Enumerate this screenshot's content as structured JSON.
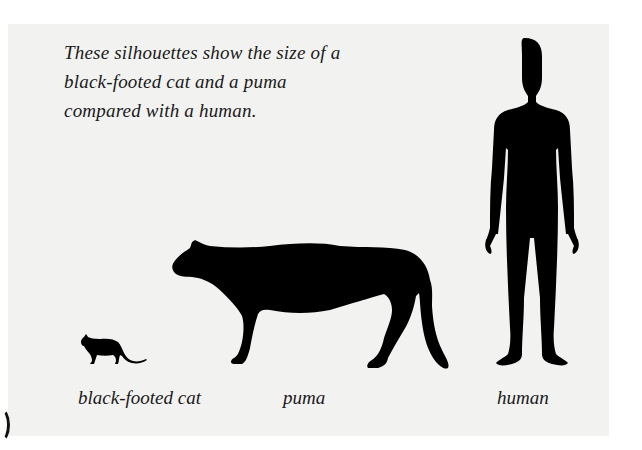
{
  "figure": {
    "caption_lines": [
      "These silhouettes show the size of a",
      "black-footed cat and a puma",
      "compared with a human."
    ],
    "labels": {
      "cat": "black-footed cat",
      "puma": "puma",
      "human": "human"
    },
    "colors": {
      "page_background": "#ffffff",
      "panel_background": "#f2f2f1",
      "silhouette": "#000000",
      "text": "#1a1a1a"
    },
    "silhouettes": [
      {
        "name": "black-footed cat",
        "icon": "cat-silhouette-icon"
      },
      {
        "name": "puma",
        "icon": "puma-silhouette-icon"
      },
      {
        "name": "human",
        "icon": "human-silhouette-icon"
      }
    ]
  }
}
